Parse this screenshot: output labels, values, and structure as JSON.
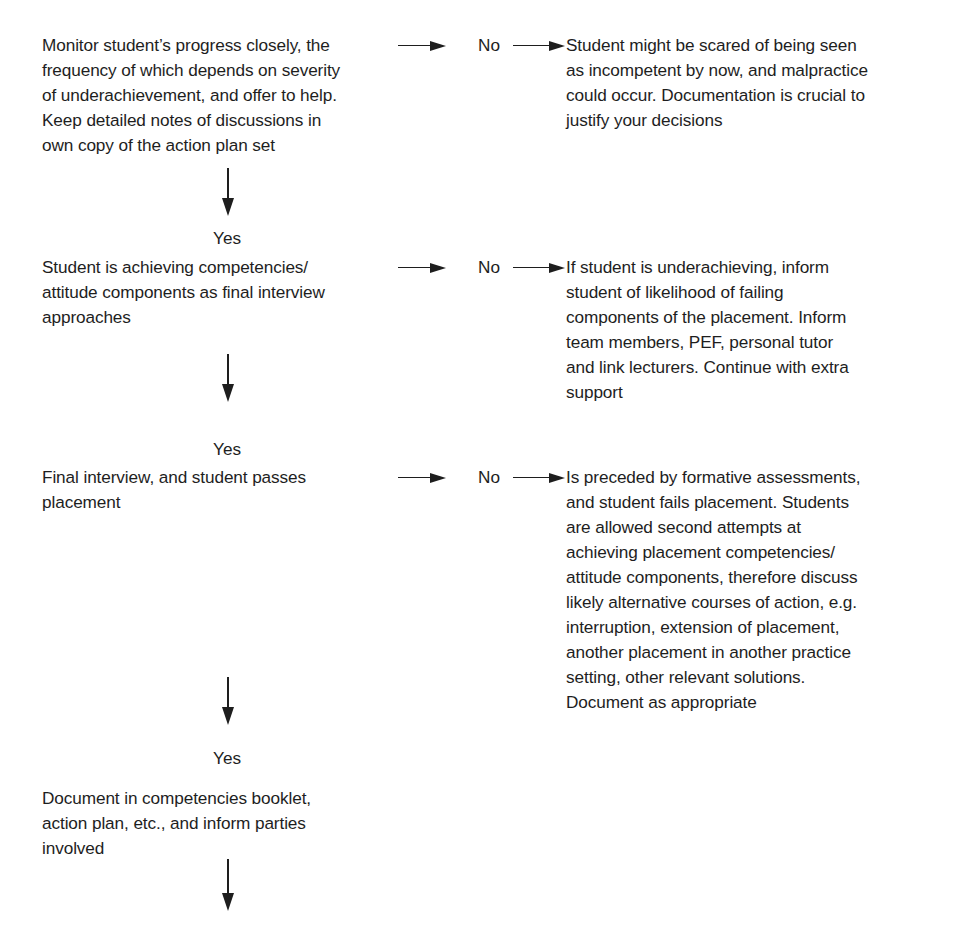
{
  "flowchart": {
    "main_steps": [
      {
        "id": "step1",
        "text": "Monitor student’s progress closely, the\nfrequency of which depends on severity\nof underachievement, and offer to help.\nKeep detailed notes of discussions in\nown copy of the action plan set"
      },
      {
        "id": "step2",
        "text": "Student is achieving competencies/\nattitude components as final interview\napproaches"
      },
      {
        "id": "step3",
        "text": "Final interview, and student passes\nplacement"
      },
      {
        "id": "step4",
        "text": "Document in competencies booklet,\naction plan, etc., and inform parties\ninvolved"
      }
    ],
    "no_branches": [
      {
        "label": "No",
        "text": "Student might be scared of being seen\nas incompetent by now, and malpractice\ncould occur. Documentation is crucial to\njustify your decisions"
      },
      {
        "label": "No",
        "text": "If student is underachieving, inform\nstudent of likelihood of failing\ncomponents of the placement. Inform\nteam members, PEF, personal tutor\nand link lecturers. Continue with extra\nsupport"
      },
      {
        "label": "No",
        "text": "Is preceded by formative assessments,\nand student fails placement. Students\nare allowed second attempts at\nachieving placement competencies/\nattitude components, therefore discuss\nlikely alternative courses of action, e.g.\ninterruption, extension of placement,\nanother placement in another practice\nsetting, other relevant solutions.\nDocument as appropriate"
      }
    ],
    "yes_labels": [
      "Yes",
      "Yes",
      "Yes"
    ],
    "colors": {
      "ink": "#1e1e1e",
      "background": "#ffffff"
    }
  }
}
